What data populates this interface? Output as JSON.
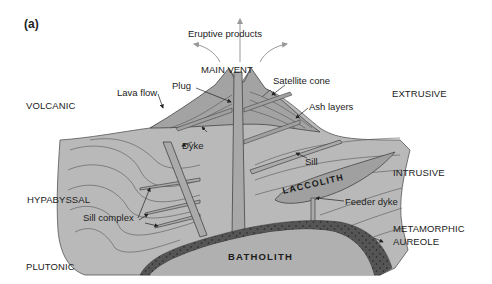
{
  "figure": {
    "panel_label": "(a)",
    "colors": {
      "background": "#ffffff",
      "rock_light": "#b9b9b9",
      "cone": "#a3a3a3",
      "intrusion": "#aaaaaa",
      "batholith": "#b0b0b0",
      "aureole": "#555555",
      "lines": "#444444",
      "arrow_grey": "#9a9a9a",
      "text": "#222222"
    }
  },
  "zones": {
    "volcanic": "VOLCANIC",
    "extrusive": "EXTRUSIVE",
    "hypabyssal": "HYPABYSSAL",
    "intrusive": "INTRUSIVE",
    "plutonic": "PLUTONIC",
    "metamorphic_line1": "METAMORPHIC",
    "metamorphic_line2": "AUREOLE"
  },
  "labels": {
    "eruptive_products": "Eruptive products",
    "main_vent": "MAIN VENT",
    "plug": "Plug",
    "lava_flow": "Lava flow",
    "satellite_cone": "Satellite cone",
    "ash_layers": "Ash layers",
    "dyke": "Dyke",
    "sill": "Sill",
    "laccolith": "LACCOLITH",
    "feeder_dyke": "Feeder dyke",
    "sill_complex": "Sill complex",
    "batholith": "BATHOLITH"
  }
}
